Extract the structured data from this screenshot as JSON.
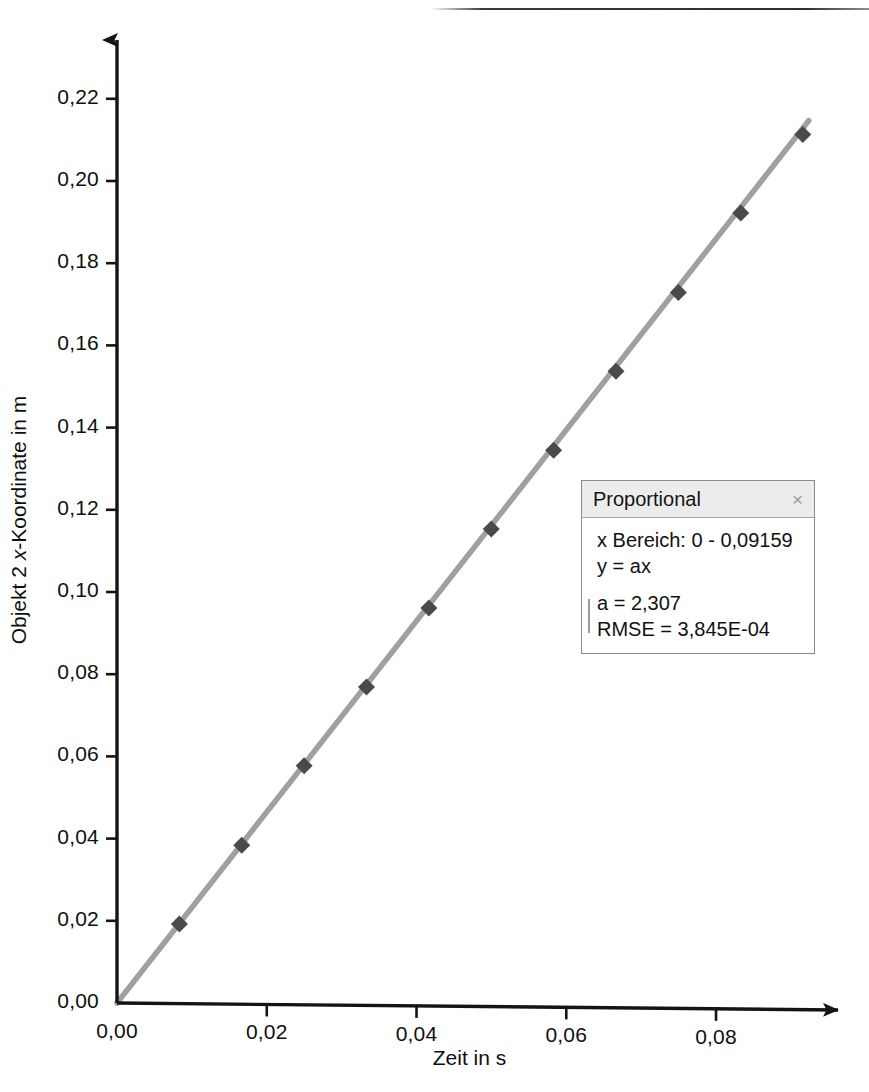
{
  "chart_data": {
    "type": "scatter",
    "title": "",
    "xlabel": "Zeit in s",
    "ylabel": "Objekt 2 x-Koordinate in m",
    "ylabel_parts": {
      "pre": "Objekt 2 ",
      "italic": "x",
      "post": "-Koordinate in m"
    },
    "xlim": [
      0,
      0.0955
    ],
    "ylim": [
      0,
      0.2285
    ],
    "grid": false,
    "legend_position": "inside-right",
    "xticks": [
      0,
      0.02,
      0.04,
      0.06,
      0.08
    ],
    "xticklabels": [
      "0,00",
      "0,02",
      "0,04",
      "0,06",
      "0,08"
    ],
    "yticks": [
      0,
      0.02,
      0.04,
      0.06,
      0.08,
      0.1,
      0.12,
      0.14,
      0.16,
      0.18,
      0.2,
      0.22
    ],
    "yticklabels": [
      "0,00",
      "0,02",
      "0,04",
      "0,06",
      "0,08",
      "0,10",
      "0,12",
      "0,14",
      "0,16",
      "0,18",
      "0,20",
      "0,22"
    ],
    "series": [
      {
        "name": "Objekt 2 x-Koordinate",
        "marker": "diamond",
        "marker_color": "#4a4a4a",
        "line_color": "#a0a0a0",
        "x": [
          0.0,
          0.00833,
          0.01666,
          0.02499,
          0.03332,
          0.04165,
          0.04998,
          0.05831,
          0.06664,
          0.07497,
          0.0833,
          0.09159
        ],
        "y": [
          0.0,
          0.0192,
          0.0384,
          0.0577,
          0.0769,
          0.0961,
          0.1153,
          0.1345,
          0.1537,
          0.1729,
          0.1922,
          0.2113
        ]
      },
      {
        "name": "Proportional fit",
        "type": "line",
        "line_color": "#a0a0a0",
        "x": [
          0.0,
          0.09159
        ],
        "y": [
          0.0,
          0.2113
        ]
      }
    ]
  },
  "legend": {
    "title": "Proportional",
    "close_icon": "×",
    "range_line": "x Bereich: 0 - 0,09159",
    "model_line": "y = ax",
    "param_a": "a = 2,307",
    "param_rmse": "RMSE = 3,845E-04"
  },
  "colors": {
    "line": "#a0a0a0",
    "marker": "#4a4a4a",
    "axis": "#141414",
    "legend_header_bg": "#ececec",
    "legend_border": "#8c8c8c"
  }
}
